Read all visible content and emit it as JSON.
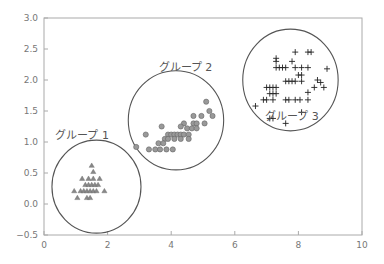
{
  "chart_data": {
    "type": "scatter",
    "title": "",
    "xlabel": "",
    "ylabel": "",
    "xlim": [
      0,
      10
    ],
    "ylim": [
      -0.5,
      3.0
    ],
    "xticks": [
      "0",
      "2",
      "4",
      "6",
      "8",
      "10"
    ],
    "yticks": [
      "-0.5",
      "0.0",
      "0.5",
      "1.0",
      "1.5",
      "2.0",
      "2.5",
      "3.0"
    ],
    "grid": false,
    "legend": "none",
    "colors": {
      "axis": "#aaaaaa",
      "circle": "#555555",
      "marker": "#888888",
      "cross": "#222222"
    },
    "series": [
      {
        "name": "グループ 1",
        "marker": "triangle",
        "label_pos": [
          1.2,
          1.05
        ],
        "circle": {
          "cx": 1.65,
          "cy": 0.28,
          "rx": 1.4,
          "ry": 0.75
        },
        "points": [
          [
            1.5,
            0.62
          ],
          [
            1.55,
            0.52
          ],
          [
            1.2,
            0.41
          ],
          [
            1.4,
            0.41
          ],
          [
            1.55,
            0.41
          ],
          [
            1.75,
            0.41
          ],
          [
            1.3,
            0.31
          ],
          [
            1.4,
            0.31
          ],
          [
            1.5,
            0.31
          ],
          [
            1.6,
            0.31
          ],
          [
            1.7,
            0.31
          ],
          [
            0.95,
            0.21
          ],
          [
            1.15,
            0.21
          ],
          [
            1.25,
            0.21
          ],
          [
            1.35,
            0.21
          ],
          [
            1.45,
            0.21
          ],
          [
            1.55,
            0.21
          ],
          [
            1.65,
            0.21
          ],
          [
            1.9,
            0.21
          ],
          [
            1.05,
            0.1
          ],
          [
            1.35,
            0.1
          ],
          [
            1.45,
            0.1
          ]
        ]
      },
      {
        "name": "グループ 2",
        "marker": "circle",
        "label_pos": [
          4.45,
          2.15
        ],
        "circle": {
          "cx": 4.15,
          "cy": 1.35,
          "rx": 1.5,
          "ry": 0.8
        },
        "points": [
          [
            5.1,
            1.65
          ],
          [
            5.2,
            1.5
          ],
          [
            5.3,
            1.42
          ],
          [
            4.7,
            1.42
          ],
          [
            4.95,
            1.42
          ],
          [
            4.4,
            1.3
          ],
          [
            4.7,
            1.3
          ],
          [
            4.8,
            1.3
          ],
          [
            5.05,
            1.3
          ],
          [
            3.7,
            1.25
          ],
          [
            4.3,
            1.25
          ],
          [
            4.5,
            1.22
          ],
          [
            4.65,
            1.22
          ],
          [
            4.8,
            1.22
          ],
          [
            3.2,
            1.12
          ],
          [
            3.9,
            1.12
          ],
          [
            4.0,
            1.12
          ],
          [
            4.1,
            1.12
          ],
          [
            4.2,
            1.12
          ],
          [
            4.3,
            1.12
          ],
          [
            4.4,
            1.12
          ],
          [
            4.55,
            1.12
          ],
          [
            3.8,
            1.05
          ],
          [
            3.9,
            1.05
          ],
          [
            4.1,
            1.05
          ],
          [
            4.3,
            1.05
          ],
          [
            4.55,
            1.05
          ],
          [
            3.6,
            0.98
          ],
          [
            3.75,
            0.98
          ],
          [
            2.9,
            0.92
          ],
          [
            3.3,
            0.88
          ],
          [
            3.5,
            0.88
          ],
          [
            3.65,
            0.88
          ],
          [
            3.85,
            0.88
          ],
          [
            4.05,
            0.88
          ]
        ]
      },
      {
        "name": "グループ 3",
        "marker": "plus",
        "label_pos": [
          7.8,
          1.35
        ],
        "circle": {
          "cx": 7.75,
          "cy": 2.0,
          "rx": 1.5,
          "ry": 0.82
        },
        "points": [
          [
            7.9,
            2.45
          ],
          [
            8.3,
            2.45
          ],
          [
            8.4,
            2.45
          ],
          [
            7.3,
            2.35
          ],
          [
            7.3,
            2.3
          ],
          [
            7.8,
            2.3
          ],
          [
            7.3,
            2.2
          ],
          [
            7.4,
            2.2
          ],
          [
            7.5,
            2.2
          ],
          [
            7.6,
            2.2
          ],
          [
            7.9,
            2.2
          ],
          [
            8.1,
            2.2
          ],
          [
            8.3,
            2.2
          ],
          [
            8.9,
            2.18
          ],
          [
            8.0,
            2.08
          ],
          [
            8.1,
            2.08
          ],
          [
            8.6,
            2.0
          ],
          [
            7.6,
            1.98
          ],
          [
            7.7,
            1.98
          ],
          [
            7.8,
            1.98
          ],
          [
            7.9,
            1.98
          ],
          [
            8.1,
            1.98
          ],
          [
            8.7,
            1.96
          ],
          [
            7.0,
            1.88
          ],
          [
            7.1,
            1.88
          ],
          [
            7.2,
            1.88
          ],
          [
            7.3,
            1.88
          ],
          [
            8.5,
            1.88
          ],
          [
            8.8,
            1.88
          ],
          [
            7.1,
            1.78
          ],
          [
            7.2,
            1.78
          ],
          [
            7.3,
            1.78
          ],
          [
            8.3,
            1.8
          ],
          [
            6.9,
            1.68
          ],
          [
            7.0,
            1.68
          ],
          [
            7.2,
            1.68
          ],
          [
            7.6,
            1.68
          ],
          [
            7.7,
            1.68
          ],
          [
            7.9,
            1.68
          ],
          [
            8.05,
            1.68
          ],
          [
            8.3,
            1.68
          ],
          [
            6.65,
            1.58
          ],
          [
            8.1,
            1.48
          ],
          [
            7.1,
            1.38
          ],
          [
            7.2,
            1.38
          ],
          [
            7.6,
            1.3
          ]
        ]
      }
    ]
  }
}
